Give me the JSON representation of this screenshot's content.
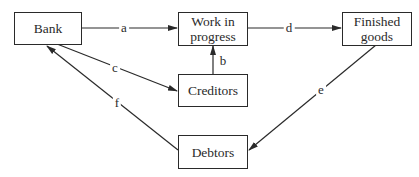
{
  "nodes": {
    "bank": {
      "label": "Bank"
    },
    "wip": {
      "label": "Work in progress",
      "line1": "Work in",
      "line2": "progress"
    },
    "finished": {
      "label": "Finished goods",
      "line1": "Finished",
      "line2": "goods"
    },
    "creditors": {
      "label": "Creditors"
    },
    "debtors": {
      "label": "Debtors"
    }
  },
  "edges": [
    {
      "id": "a",
      "label": "a",
      "from": "Bank",
      "to": "Work in progress"
    },
    {
      "id": "b",
      "label": "b",
      "from": "Creditors",
      "to": "Work in progress"
    },
    {
      "id": "c",
      "label": "c",
      "from": "Bank",
      "to": "Creditors"
    },
    {
      "id": "d",
      "label": "d",
      "from": "Work in progress",
      "to": "Finished goods"
    },
    {
      "id": "e",
      "label": "e",
      "from": "Finished goods",
      "to": "Debtors"
    },
    {
      "id": "f",
      "label": "f",
      "from": "Debtors",
      "to": "Bank"
    }
  ]
}
